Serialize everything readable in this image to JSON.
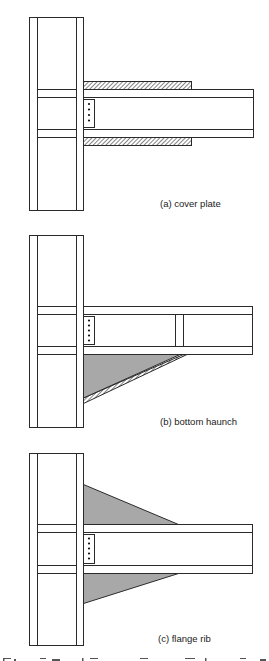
{
  "figure": {
    "panels": [
      {
        "id": "a",
        "label": "(a) cover plate"
      },
      {
        "id": "b",
        "label": "(b) bottom haunch"
      },
      {
        "id": "c",
        "label": "(c) flange rib"
      }
    ],
    "caption_partial": "Figure ... Various Connection Configurations (caption cropped)"
  },
  "colors": {
    "line": "#2a2a2a",
    "shaded_fill": "#a8a8a8",
    "background": "#ffffff"
  }
}
